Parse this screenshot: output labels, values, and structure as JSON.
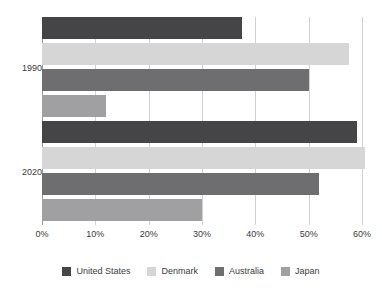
{
  "chart_data": {
    "type": "bar",
    "orientation": "horizontal",
    "title": "",
    "xlabel": "",
    "ylabel": "",
    "categories": [
      "1990",
      "2020"
    ],
    "xlim": [
      0,
      60
    ],
    "xticks": [
      0,
      10,
      20,
      30,
      40,
      50,
      60
    ],
    "xtick_labels": [
      "0%",
      "10%",
      "20%",
      "30%",
      "40%",
      "50%",
      "60%"
    ],
    "grid": true,
    "legend_position": "bottom",
    "value_suffix": "%",
    "series": [
      {
        "name": "United States",
        "color": "#454548",
        "values": [
          37.5,
          59.0
        ]
      },
      {
        "name": "Denmark",
        "color": "#d6d6d6",
        "values": [
          57.5,
          60.5
        ]
      },
      {
        "name": "Australia",
        "color": "#6e6e70",
        "values": [
          50.0,
          52.0
        ]
      },
      {
        "name": "Japan",
        "color": "#a0a0a2",
        "values": [
          12.0,
          30.0
        ]
      }
    ]
  },
  "axis": {
    "zero_line_color": "#9a9a9a",
    "gridline_color": "#d2d2d2"
  }
}
